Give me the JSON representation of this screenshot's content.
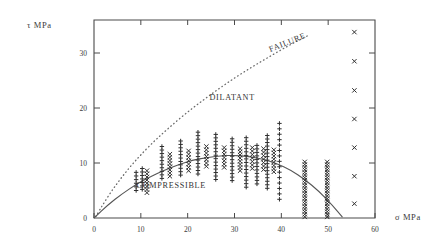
{
  "chart_data": {
    "type": "scatter",
    "title": "",
    "subtitle": "",
    "xlabel": "σ  MPa",
    "ylabel": "τ  MPa",
    "xlim": [
      0,
      60
    ],
    "ylim": [
      0,
      36
    ],
    "xticks": [
      0,
      10,
      20,
      30,
      40,
      50,
      60
    ],
    "yticks": [
      0,
      10,
      20,
      30
    ],
    "xticklabels": [
      "0",
      "10",
      "20",
      "30",
      "40",
      "50",
      "60"
    ],
    "yticklabels": [
      "0",
      "10",
      "20",
      "30"
    ],
    "grid": false,
    "legend_position": "none",
    "annotations": [
      {
        "text": "FAILURE",
        "x": 41.5,
        "y": 31.5,
        "rotation": -22
      },
      {
        "text": "DILATANT",
        "x": 29.5,
        "y": 21.5,
        "rotation": 0
      },
      {
        "text": "COMPRESSIBLE",
        "x": 16.5,
        "y": 5.4,
        "rotation": 0
      }
    ],
    "series": [
      {
        "name": "failure-envelope",
        "type": "line",
        "style": "dotted",
        "color": "#6b6b6b",
        "x": [
          0.4,
          2,
          4,
          6,
          8,
          10,
          13,
          16,
          19,
          22,
          25,
          28,
          31,
          34,
          37,
          40,
          43,
          46
        ],
        "y": [
          0.3,
          2.6,
          5.2,
          7.5,
          9.6,
          11.5,
          14.1,
          16.4,
          18.6,
          20.6,
          22.5,
          24.3,
          26.0,
          27.6,
          29.1,
          30.6,
          32.0,
          33.3
        ]
      },
      {
        "name": "dilatancy-boundary",
        "type": "line",
        "style": "solid",
        "color": "#555555",
        "x": [
          0,
          3,
          6,
          9,
          12,
          15,
          18,
          21,
          24,
          27,
          30,
          33,
          36,
          39,
          42,
          45,
          48,
          51,
          53
        ],
        "y": [
          0,
          2.4,
          4.4,
          6.1,
          7.5,
          8.7,
          9.7,
          10.5,
          11.0,
          11.3,
          11.4,
          11.2,
          10.7,
          9.9,
          8.7,
          7.0,
          4.9,
          2.2,
          0.2
        ]
      },
      {
        "name": "plus-markers",
        "type": "scatter",
        "marker": "plus",
        "color": "#2f2f2f",
        "columns": [
          {
            "x": 9.0,
            "ymin": 5.0,
            "ymax": 8.3,
            "count": 6
          },
          {
            "x": 10.3,
            "ymin": 5.2,
            "ymax": 9.0,
            "count": 7
          },
          {
            "x": 14.5,
            "ymin": 7.2,
            "ymax": 13.0,
            "count": 10
          },
          {
            "x": 18.5,
            "ymin": 7.8,
            "ymax": 14.0,
            "count": 11
          },
          {
            "x": 22.2,
            "ymin": 8.0,
            "ymax": 15.6,
            "count": 13
          },
          {
            "x": 26.0,
            "ymin": 7.0,
            "ymax": 15.2,
            "count": 14
          },
          {
            "x": 29.5,
            "ymin": 6.8,
            "ymax": 14.4,
            "count": 13
          },
          {
            "x": 32.5,
            "ymin": 5.6,
            "ymax": 14.6,
            "count": 15
          },
          {
            "x": 34.8,
            "ymin": 6.2,
            "ymax": 13.2,
            "count": 12
          },
          {
            "x": 37.0,
            "ymin": 5.4,
            "ymax": 15.0,
            "count": 16
          },
          {
            "x": 39.6,
            "ymin": 3.4,
            "ymax": 17.2,
            "count": 15
          }
        ]
      },
      {
        "name": "cross-markers",
        "type": "scatter",
        "marker": "cross",
        "color": "#2f2f2f",
        "columns": [
          {
            "x": 11.3,
            "ymin": 4.6,
            "ymax": 8.6,
            "count": 8
          },
          {
            "x": 16.2,
            "ymin": 7.6,
            "ymax": 11.6,
            "count": 8
          },
          {
            "x": 20.2,
            "ymin": 8.6,
            "ymax": 12.2,
            "count": 7
          },
          {
            "x": 24.0,
            "ymin": 9.4,
            "ymax": 13.0,
            "count": 7
          },
          {
            "x": 27.8,
            "ymin": 9.2,
            "ymax": 12.8,
            "count": 7
          },
          {
            "x": 31.2,
            "ymin": 8.6,
            "ymax": 12.6,
            "count": 8
          },
          {
            "x": 33.8,
            "ymin": 9.0,
            "ymax": 12.8,
            "count": 7
          },
          {
            "x": 36.2,
            "ymin": 8.8,
            "ymax": 12.6,
            "count": 7
          },
          {
            "x": 38.4,
            "ymin": 8.4,
            "ymax": 12.4,
            "count": 8
          },
          {
            "x": 45.0,
            "ymin": 0.2,
            "ymax": 10.2,
            "count": 22
          },
          {
            "x": 49.8,
            "ymin": 0.2,
            "ymax": 10.2,
            "count": 22
          }
        ]
      },
      {
        "name": "right-edge-crosses",
        "type": "scatter",
        "marker": "cross",
        "color": "#2f2f2f",
        "x": [
          55.6,
          55.6,
          55.6,
          55.6,
          55.6,
          55.6,
          55.6
        ],
        "y": [
          33.8,
          28.5,
          23.2,
          18.0,
          12.8,
          7.6,
          2.6
        ]
      }
    ]
  },
  "labels": {
    "ylabel": "τ  MPa",
    "xlabel": "σ  MPa"
  }
}
